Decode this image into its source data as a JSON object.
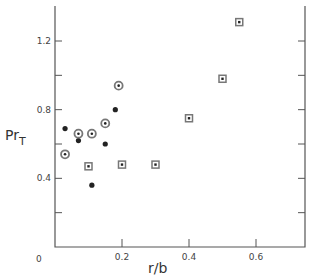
{
  "chart_data": {
    "type": "scatter",
    "title": "",
    "xlabel": "r/b",
    "ylabel": "Pr",
    "ylabel_subscript": "T",
    "xlim": [
      0,
      0.75
    ],
    "ylim": [
      0,
      1.4
    ],
    "x_ticks": [
      0.2,
      0.4,
      0.6
    ],
    "x_tick_labels": [
      "0.2",
      "0.4",
      "0.6"
    ],
    "y_ticks": [
      0.4,
      0.8,
      1.2
    ],
    "y_tick_labels": [
      "0.4",
      "0.8",
      "1.2"
    ],
    "origin_label": "0",
    "grid": false,
    "legend": null,
    "series": [
      {
        "name": "filled-circle",
        "marker": "filled-dot",
        "points": [
          {
            "x": 0.03,
            "y": 0.69
          },
          {
            "x": 0.07,
            "y": 0.62
          },
          {
            "x": 0.11,
            "y": 0.36
          },
          {
            "x": 0.15,
            "y": 0.6
          },
          {
            "x": 0.18,
            "y": 0.8
          }
        ]
      },
      {
        "name": "circled-dot",
        "marker": "circle-with-dot",
        "points": [
          {
            "x": 0.03,
            "y": 0.54
          },
          {
            "x": 0.07,
            "y": 0.66
          },
          {
            "x": 0.11,
            "y": 0.66
          },
          {
            "x": 0.15,
            "y": 0.72
          },
          {
            "x": 0.19,
            "y": 0.94
          }
        ]
      },
      {
        "name": "boxed-dot",
        "marker": "square-with-dot",
        "points": [
          {
            "x": 0.1,
            "y": 0.47
          },
          {
            "x": 0.2,
            "y": 0.48
          },
          {
            "x": 0.3,
            "y": 0.48
          },
          {
            "x": 0.4,
            "y": 0.75
          },
          {
            "x": 0.5,
            "y": 0.98
          },
          {
            "x": 0.55,
            "y": 1.31
          }
        ]
      }
    ]
  },
  "colors": {
    "axis": "#555555",
    "marker": "#222222",
    "marker_ring": "#777777"
  }
}
